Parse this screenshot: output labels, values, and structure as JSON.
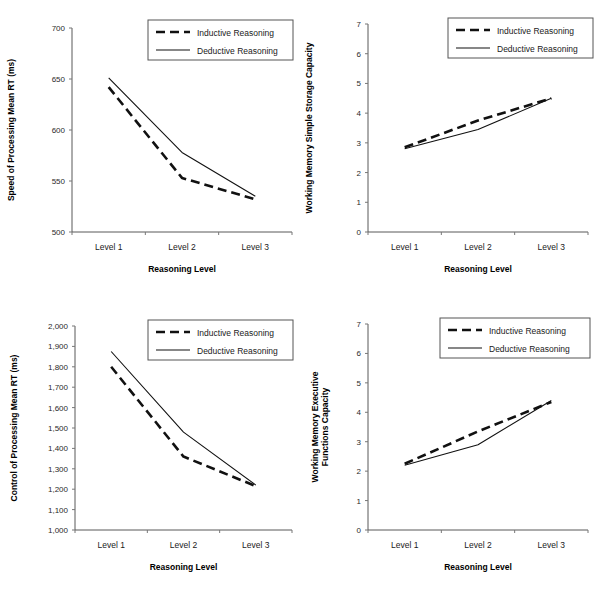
{
  "figure": {
    "panel_count": 4,
    "legend_entries": [
      "Inductive Reasoning",
      "Deductive Reasoning"
    ],
    "categories": [
      "Level 1",
      "Level 2",
      "Level 3"
    ],
    "xlabel": "Reasoning Level"
  },
  "chart_data": [
    {
      "id": "speed-of-processing",
      "type": "line",
      "title": "",
      "ylabel": "Speed of Processing Mean RT (ms)",
      "xlabel": "Reasoning Level",
      "categories": [
        "Level 1",
        "Level 2",
        "Level 3"
      ],
      "ylim": [
        500,
        700
      ],
      "yticks": [
        500,
        550,
        600,
        650,
        700
      ],
      "ytick_labels": [
        "500",
        "550",
        "600",
        "650",
        "700"
      ],
      "grid": false,
      "legend_position": "top-right",
      "series": [
        {
          "name": "Inductive Reasoning",
          "style": "dashed",
          "values": [
            642,
            553,
            532
          ]
        },
        {
          "name": "Deductive Reasoning",
          "style": "solid",
          "values": [
            651,
            578,
            535
          ]
        }
      ]
    },
    {
      "id": "wm-simple-storage-capacity",
      "type": "line",
      "title": "",
      "ylabel": "Working Memory Simple Storage Capacity",
      "xlabel": "Reasoning Level",
      "categories": [
        "Level 1",
        "Level 2",
        "Level 3"
      ],
      "ylim": [
        0,
        7
      ],
      "yticks": [
        0,
        1,
        2,
        3,
        4,
        5,
        6,
        7
      ],
      "ytick_labels": [
        "0",
        "1",
        "2",
        "3",
        "4",
        "5",
        "6",
        "7"
      ],
      "grid": false,
      "legend_position": "top-right",
      "series": [
        {
          "name": "Inductive Reasoning",
          "style": "dashed",
          "values": [
            2.85,
            3.75,
            4.5
          ]
        },
        {
          "name": "Deductive Reasoning",
          "style": "solid",
          "values": [
            2.8,
            3.45,
            4.5
          ]
        }
      ]
    },
    {
      "id": "control-of-processing",
      "type": "line",
      "title": "",
      "ylabel": "Control of Processing Mean RT (ms)",
      "xlabel": "Reasoning Level",
      "categories": [
        "Level 1",
        "Level 2",
        "Level 3"
      ],
      "ylim": [
        1000,
        2000
      ],
      "yticks": [
        1000,
        1100,
        1200,
        1300,
        1400,
        1500,
        1600,
        1700,
        1800,
        1900,
        2000
      ],
      "ytick_labels": [
        "1,000",
        "1,100",
        "1,200",
        "1,300",
        "1,400",
        "1,500",
        "1,600",
        "1,700",
        "1,800",
        "1,900",
        "2,000"
      ],
      "grid": false,
      "legend_position": "top-right",
      "series": [
        {
          "name": "Inductive Reasoning",
          "style": "dashed",
          "values": [
            1800,
            1360,
            1215
          ]
        },
        {
          "name": "Deductive Reasoning",
          "style": "solid",
          "values": [
            1875,
            1480,
            1220
          ]
        }
      ]
    },
    {
      "id": "wm-executive-functions-capacity",
      "type": "line",
      "title": "",
      "ylabel": "Working Memory Executive Functions Capacity",
      "ylabel_lines": [
        "Working Memory Executive",
        "Functions Capacity"
      ],
      "xlabel": "Reasoning Level",
      "categories": [
        "Level 1",
        "Level 2",
        "Level 3"
      ],
      "ylim": [
        0,
        7
      ],
      "yticks": [
        0,
        1,
        2,
        3,
        4,
        5,
        6,
        7
      ],
      "ytick_labels": [
        "0",
        "1",
        "2",
        "3",
        "4",
        "5",
        "6",
        "7"
      ],
      "grid": false,
      "legend_position": "top-right",
      "series": [
        {
          "name": "Inductive Reasoning",
          "style": "dashed",
          "values": [
            2.25,
            3.35,
            4.35
          ]
        },
        {
          "name": "Deductive Reasoning",
          "style": "solid",
          "values": [
            2.2,
            2.9,
            4.4
          ]
        }
      ]
    }
  ]
}
